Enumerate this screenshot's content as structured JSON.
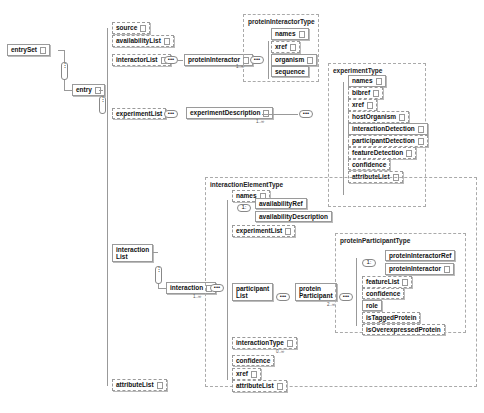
{
  "root": {
    "entrySet": "entrySet",
    "entry": "entry"
  },
  "entry_children": [
    "source",
    "availabilityList",
    "interactorList",
    "experimentList",
    "interaction\nList",
    "attributeList"
  ],
  "interactorList": {
    "child": "proteinInteractor",
    "cardinality": "1..∞"
  },
  "proteinInteractorType": {
    "label": "proteinInteractorType",
    "children": [
      "names",
      "xref",
      "organism",
      "sequence"
    ]
  },
  "experimentList": {
    "child": "experimentDescription",
    "cardinality": "1..∞"
  },
  "experimentType": {
    "label": "experimentType",
    "children": [
      "names",
      "bibref",
      "xref",
      "hostOrganism",
      "interactionDetection",
      "participantDetection",
      "featureDetection",
      "confidence",
      "attributeList"
    ]
  },
  "interactionList": {
    "child": "interaction",
    "cardinality": "1..∞"
  },
  "interactionElementType": {
    "label": "interactionElementType",
    "children": [
      "names",
      "availabilityRef",
      "availabilityDescription",
      "experimentList",
      "participant\nList",
      "interactionType",
      "confidence",
      "xref",
      "attributeList"
    ],
    "interactionType_cardinality": "0..∞"
  },
  "participantList": {
    "child": "protein\nParticipant",
    "cardinality": "2..∞"
  },
  "proteinParticipantType": {
    "label": "proteinParticipantType",
    "children": [
      "proteinInteractorRef",
      "proteinInteractor",
      "featureList",
      "confidence",
      "role",
      "isTaggedProtein",
      "isOverexpressedProtein"
    ]
  },
  "symbols": {
    "sequence": "•••",
    "choice": "1:",
    "sequence_v": "⋮"
  },
  "colors": {
    "line": "#999999",
    "border": "#9a9a9a",
    "text": "#111111",
    "background": "#ffffff"
  }
}
